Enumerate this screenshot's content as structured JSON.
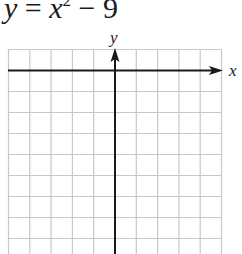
{
  "equation": {
    "lhs": "y",
    "eq": " = ",
    "base": "x",
    "exponent": "2",
    "rest": " − 9",
    "full": "y = x² − 9"
  },
  "graph": {
    "x_axis_label": "x",
    "y_axis_label": "y",
    "grid_columns": 10,
    "grid_rows_visible": 10,
    "grid_color": "#c8c8c8",
    "axis_color": "#1a1a1a"
  }
}
